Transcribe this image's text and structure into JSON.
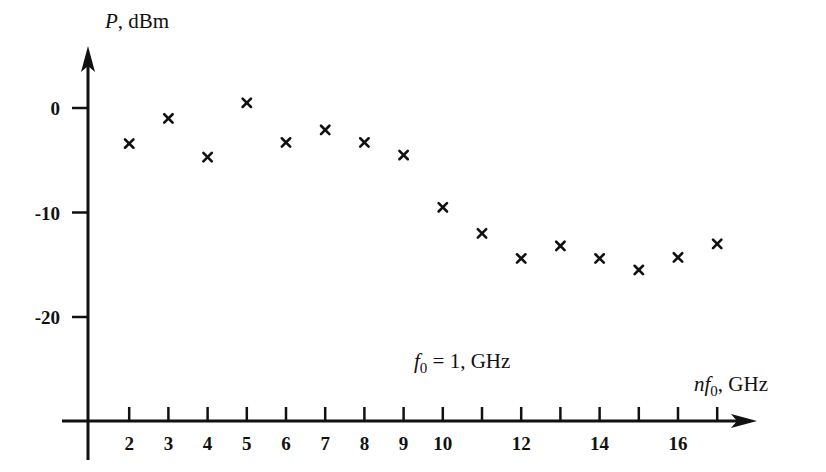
{
  "chart_data": {
    "type": "scatter",
    "title": "",
    "annotation": "f0 = 1, GHz",
    "xlabel": "nf0, GHz",
    "ylabel": "P, dBm",
    "x_ticks": [
      2,
      3,
      4,
      5,
      6,
      7,
      8,
      9,
      10,
      11,
      12,
      13,
      14,
      15,
      16,
      17
    ],
    "x_tick_labels": [
      "2",
      "3",
      "4",
      "5",
      "6",
      "7",
      "8",
      "9",
      "10",
      "",
      "12",
      "",
      "14",
      "",
      "16",
      ""
    ],
    "y_ticks": [
      0,
      -10,
      -20
    ],
    "y_tick_labels": [
      "0",
      "-10",
      "-20"
    ],
    "xlim": [
      1,
      18.5
    ],
    "ylim": [
      -30,
      6
    ],
    "grid": false,
    "legend": null,
    "marker": "x",
    "series": [
      {
        "name": "harmonic power",
        "x": [
          2,
          3,
          4,
          5,
          6,
          7,
          8,
          9,
          10,
          11,
          12,
          13,
          14,
          15,
          16,
          17
        ],
        "values": [
          -3.4,
          -1.0,
          -4.7,
          0.5,
          -3.3,
          -2.1,
          -3.3,
          -4.5,
          -9.5,
          -12.0,
          -14.4,
          -13.2,
          -14.4,
          -15.5,
          -14.3,
          -13.0
        ]
      }
    ]
  },
  "labels": {
    "y_axis_title_var": "P",
    "y_axis_title_unit": ", dBm",
    "x_axis_title_var": "nf",
    "x_axis_title_sub": "0",
    "x_axis_title_unit": ", GHz",
    "annotation_var": "f",
    "annotation_sub": "0",
    "annotation_rest": " = 1, GHz"
  }
}
